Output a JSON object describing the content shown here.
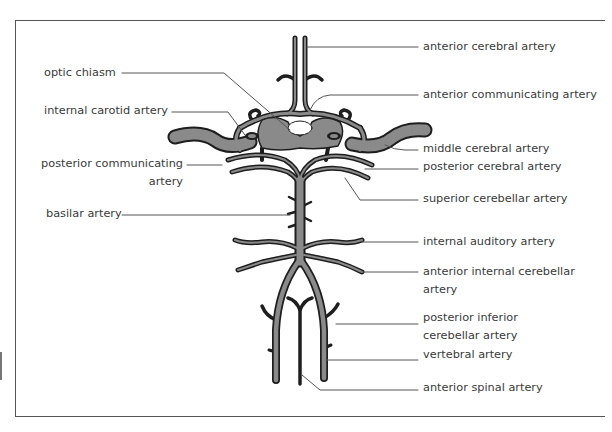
{
  "figure": {
    "left_labels": [
      {
        "id": "optic-chiasm",
        "text": "optic chiasm"
      },
      {
        "id": "internal-carotid-artery",
        "text": "internal carotid artery"
      },
      {
        "id": "posterior-communicating-artery",
        "line1": "posterior communicating",
        "line2": "artery"
      },
      {
        "id": "basilar-artery",
        "text": "basilar artery"
      }
    ],
    "right_labels": [
      {
        "id": "anterior-cerebral-artery",
        "text": "anterior cerebral artery"
      },
      {
        "id": "anterior-communicating-artery",
        "text": "anterior communicating artery"
      },
      {
        "id": "middle-cerebral-artery",
        "text": "middle cerebral artery"
      },
      {
        "id": "posterior-cerebral-artery",
        "text": "posterior cerebral artery"
      },
      {
        "id": "superior-cerebellar-artery",
        "text": "superior cerebellar artery"
      },
      {
        "id": "internal-auditory-artery",
        "text": "internal auditory artery"
      },
      {
        "id": "anterior-internal-cerebellar-artery",
        "line1": "anterior internal cerebellar",
        "line2": "artery"
      },
      {
        "id": "posterior-inferior-cerebellar-artery",
        "line1": "posterior inferior",
        "line2": "cerebellar artery"
      },
      {
        "id": "vertebral-artery",
        "text": "vertebral artery"
      },
      {
        "id": "anterior-spinal-artery",
        "text": "anterior spinal artery"
      }
    ]
  },
  "colors": {
    "artery_fill": "#8a8a8a",
    "artery_outline": "#1e1e1e",
    "leader_line": "#555555",
    "text": "#3a3a3a"
  }
}
